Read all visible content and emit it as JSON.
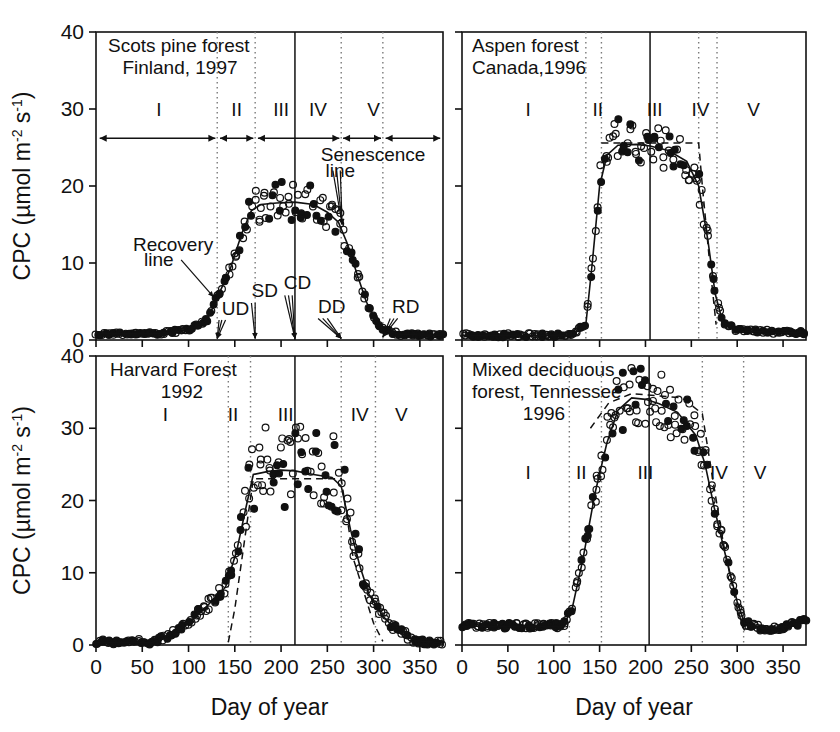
{
  "figure": {
    "axis_titles": {
      "x": "Day of year",
      "y_main": "CPC (µmol m",
      "y_sup1": "-2",
      "y_mid": " s",
      "y_sup2": "-1",
      "y_close": ")"
    },
    "y_axis_label_full": "CPC (µmol m-2 s-1)",
    "colors": {
      "ink": "#111111",
      "grid": "#7a7a7a",
      "background": "#ffffff"
    }
  },
  "axes": {
    "x": {
      "label": "Day of year",
      "min": 0,
      "max": 375,
      "ticks": [
        0,
        50,
        100,
        150,
        200,
        250,
        300,
        350
      ],
      "ticklabels": [
        "0",
        "50",
        "100",
        "150",
        "200",
        "250",
        "300",
        "350"
      ]
    },
    "y": {
      "label": "CPC (µmol m-2 s-1)",
      "min": 0,
      "max": 40,
      "ticks": [
        0,
        10,
        20,
        30,
        40
      ],
      "ticklabels": [
        "0",
        "10",
        "20",
        "30",
        "40"
      ]
    }
  },
  "panels": [
    {
      "id": "scots-pine",
      "position": "top-left",
      "title_lines": [
        "Scots pine forest",
        "Finland, 1997"
      ],
      "phase_labels": [
        "I",
        "II",
        "III",
        "IV",
        "V"
      ],
      "phase_label_x": [
        68,
        152,
        200,
        240,
        300
      ],
      "phase_label_y": 30,
      "phase_boundaries_dotted": [
        131,
        172,
        265,
        310
      ],
      "solid_vertical_x": 215,
      "show_phase_arrows": true,
      "arrow_segments": [
        [
          4,
          129
        ],
        [
          134,
          170
        ],
        [
          175,
          263
        ],
        [
          267,
          308
        ],
        [
          313,
          372
        ]
      ],
      "arrow_y": 26.2,
      "annotations": [
        {
          "name": "recovery-line-label",
          "text": "Recovery",
          "x": 40,
          "y": 11.6
        },
        {
          "name": "recovery-line-label2",
          "text": "line",
          "x": 52,
          "y": 9.6
        },
        {
          "name": "senescence-line-label",
          "text": "Senescence",
          "x": 243,
          "y": 23.2
        },
        {
          "name": "senescence-line-label2",
          "text": "line",
          "x": 248,
          "y": 21.2
        },
        {
          "name": "ud-label",
          "text": "UD",
          "x": 136,
          "y": 3.3
        },
        {
          "name": "sd-label",
          "text": "SD",
          "x": 168,
          "y": 5.6
        },
        {
          "name": "cd-label",
          "text": "CD",
          "x": 203,
          "y": 6.6
        },
        {
          "name": "dd-label",
          "text": "DD",
          "x": 240,
          "y": 3.5
        },
        {
          "name": "rd-label",
          "text": "RD",
          "x": 320,
          "y": 3.5
        }
      ],
      "leader_lines": [
        {
          "from": [
            92,
            10.4
          ],
          "to": [
            127,
            5.6
          ]
        },
        {
          "from": [
            133,
            2.6
          ],
          "to": [
            131,
            0.2
          ]
        },
        {
          "from": [
            136,
            2.6
          ],
          "to": [
            131,
            0.2
          ]
        },
        {
          "from": [
            140,
            2.6
          ],
          "to": [
            131,
            0.2
          ]
        },
        {
          "from": [
            168,
            4.8
          ],
          "to": [
            172,
            0.2
          ]
        },
        {
          "from": [
            172,
            4.8
          ],
          "to": [
            172,
            0.2
          ]
        },
        {
          "from": [
            204,
            5.8
          ],
          "to": [
            215,
            0.2
          ]
        },
        {
          "from": [
            208,
            5.8
          ],
          "to": [
            215,
            0.2
          ]
        },
        {
          "from": [
            212,
            5.8
          ],
          "to": [
            215,
            0.2
          ]
        },
        {
          "from": [
            240,
            2.8
          ],
          "to": [
            265,
            0.2
          ]
        },
        {
          "from": [
            245,
            2.8
          ],
          "to": [
            265,
            0.2
          ]
        },
        {
          "from": [
            250,
            2.8
          ],
          "to": [
            265,
            0.2
          ]
        },
        {
          "from": [
            256,
            22.0
          ],
          "to": [
            266,
            15.0
          ]
        },
        {
          "from": [
            260,
            22.0
          ],
          "to": [
            266,
            15.0
          ]
        },
        {
          "from": [
            264,
            22.0
          ],
          "to": [
            266,
            15.0
          ]
        },
        {
          "from": [
            318,
            2.8
          ],
          "to": [
            310,
            0.4
          ]
        },
        {
          "from": [
            322,
            2.8
          ],
          "to": [
            310,
            0.4
          ]
        },
        {
          "from": [
            326,
            2.8
          ],
          "to": [
            310,
            0.4
          ]
        }
      ],
      "series": {
        "fit_curve": [
          [
            0,
            0.8
          ],
          [
            60,
            0.8
          ],
          [
            80,
            1.0
          ],
          [
            100,
            1.3
          ],
          [
            120,
            2.6
          ],
          [
            131,
            5.5
          ],
          [
            145,
            9.2
          ],
          [
            158,
            14.0
          ],
          [
            168,
            16.8
          ],
          [
            178,
            17.6
          ],
          [
            195,
            17.8
          ],
          [
            215,
            17.9
          ],
          [
            235,
            17.6
          ],
          [
            250,
            16.6
          ],
          [
            262,
            15.3
          ],
          [
            272,
            12.4
          ],
          [
            282,
            8.6
          ],
          [
            292,
            5.0
          ],
          [
            302,
            2.6
          ],
          [
            312,
            1.2
          ],
          [
            330,
            0.7
          ],
          [
            375,
            0.6
          ]
        ],
        "baseline_level": 0.7,
        "plateau_level": 17.8,
        "scatter_n": 200
      }
    },
    {
      "id": "aspen",
      "position": "top-right",
      "title_lines": [
        "Aspen forest",
        "Canada,1996"
      ],
      "phase_labels": [
        "I",
        "II",
        "III",
        "IV",
        "V"
      ],
      "phase_label_x": [
        72,
        148,
        210,
        260,
        318
      ],
      "phase_label_y": 30,
      "phase_boundaries_dotted": [
        135,
        152,
        258,
        278
      ],
      "solid_vertical_x": 205,
      "show_phase_arrows": false,
      "annotations": [],
      "leader_lines": [],
      "series": {
        "fit_curve": [
          [
            0,
            0.6
          ],
          [
            120,
            0.6
          ],
          [
            135,
            2.0
          ],
          [
            142,
            10.0
          ],
          [
            150,
            20.0
          ],
          [
            158,
            24.0
          ],
          [
            170,
            25.3
          ],
          [
            190,
            25.4
          ],
          [
            205,
            25.2
          ],
          [
            225,
            24.6
          ],
          [
            245,
            23.2
          ],
          [
            258,
            20.0
          ],
          [
            268,
            13.0
          ],
          [
            276,
            6.0
          ],
          [
            284,
            2.4
          ],
          [
            300,
            1.2
          ],
          [
            340,
            1.0
          ],
          [
            375,
            0.9
          ]
        ],
        "dashed_curve": [
          [
            152,
            25.6
          ],
          [
            258,
            25.6
          ],
          [
            262,
            20.0
          ],
          [
            270,
            10.0
          ],
          [
            277,
            2.0
          ]
        ],
        "baseline_level": 0.8,
        "plateau_level": 25.2,
        "scatter_n": 200
      }
    },
    {
      "id": "harvard-forest",
      "position": "bottom-left",
      "title_lines": [
        "Harvard Forest",
        "1992"
      ],
      "phase_labels": [
        "I",
        "II",
        "III",
        "IV",
        "V"
      ],
      "phase_label_x": [
        75,
        148,
        205,
        285,
        330
      ],
      "phase_label_y": 32,
      "phase_boundaries_dotted": [
        143,
        167,
        265,
        302
      ],
      "solid_vertical_x": 215,
      "show_phase_arrows": false,
      "annotations": [],
      "leader_lines": [],
      "series": {
        "fit_curve": [
          [
            0,
            0.3
          ],
          [
            60,
            0.3
          ],
          [
            80,
            1.4
          ],
          [
            100,
            3.0
          ],
          [
            120,
            5.4
          ],
          [
            140,
            8.0
          ],
          [
            152,
            13.0
          ],
          [
            162,
            19.0
          ],
          [
            170,
            23.6
          ],
          [
            185,
            24.0
          ],
          [
            200,
            24.2
          ],
          [
            215,
            24.1
          ],
          [
            235,
            23.6
          ],
          [
            255,
            23.2
          ],
          [
            265,
            22.0
          ],
          [
            275,
            16.0
          ],
          [
            285,
            11.0
          ],
          [
            295,
            7.0
          ],
          [
            310,
            4.0
          ],
          [
            325,
            2.0
          ],
          [
            345,
            0.6
          ],
          [
            375,
            0.3
          ]
        ],
        "dashed_curve": [
          [
            143,
            0.4
          ],
          [
            150,
            5.0
          ],
          [
            160,
            14.0
          ],
          [
            170,
            23.0
          ],
          [
            265,
            23.0
          ],
          [
            278,
            12.0
          ],
          [
            300,
            3.0
          ],
          [
            310,
            0.5
          ]
        ],
        "baseline_level": 0.3,
        "plateau_level": 24.0,
        "scatter_n": 230
      }
    },
    {
      "id": "mixed-deciduous",
      "position": "bottom-right",
      "title_lines": [
        "Mixed deciduous",
        "forest, Tennessee",
        "1996"
      ],
      "phase_labels": [
        "I",
        "II",
        "III",
        "IV",
        "V"
      ],
      "phase_label_x": [
        72,
        130,
        200,
        280,
        325
      ],
      "phase_label_y": 24,
      "phase_boundaries_dotted": [
        117,
        152,
        262,
        307
      ],
      "solid_vertical_x": 204,
      "show_phase_arrows": false,
      "annotations": [],
      "leader_lines": [],
      "series": {
        "fit_curve": [
          [
            0,
            2.6
          ],
          [
            60,
            2.6
          ],
          [
            110,
            2.6
          ],
          [
            120,
            5.0
          ],
          [
            132,
            12.0
          ],
          [
            145,
            21.0
          ],
          [
            158,
            28.0
          ],
          [
            170,
            32.5
          ],
          [
            185,
            34.2
          ],
          [
            200,
            34.0
          ],
          [
            215,
            33.4
          ],
          [
            235,
            32.2
          ],
          [
            255,
            29.0
          ],
          [
            265,
            25.0
          ],
          [
            275,
            19.0
          ],
          [
            288,
            12.0
          ],
          [
            300,
            6.0
          ],
          [
            308,
            3.0
          ],
          [
            330,
            2.2
          ],
          [
            355,
            2.6
          ],
          [
            375,
            3.4
          ]
        ],
        "dashed_curve": [
          [
            140,
            30.0
          ],
          [
            160,
            33.5
          ],
          [
            185,
            34.8
          ],
          [
            240,
            34.2
          ],
          [
            262,
            32.0
          ],
          [
            272,
            24.0
          ],
          [
            285,
            14.0
          ],
          [
            300,
            5.0
          ],
          [
            308,
            2.0
          ]
        ],
        "baseline_level": 2.6,
        "plateau_level": 34.0,
        "scatter_n": 240
      }
    }
  ]
}
